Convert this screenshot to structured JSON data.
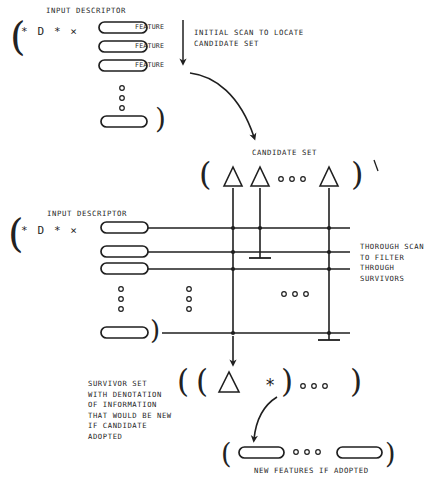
{
  "diagram": {
    "title_top": "INPUT DESCRIPTOR",
    "title_mid": "INPUT DESCRIPTOR",
    "descriptor_notation": "* D * ×",
    "feature_labels": [
      "FEATURE",
      "FEATURE",
      "FEATURE"
    ],
    "annotations": {
      "initial_scan": "INITIAL SCAN TO LOCATE\nCANDIDATE SET",
      "candidate_set": "CANDIDATE SET",
      "thorough_scan": "THOROUGH SCAN\nTO FILTER\nTHROUGH\nSURVIVORS",
      "survivor_set": "SURVIVOR SET\nWITH DENOTATION\nOF INFORMATION\nTHAT WOULD BE NEW\nIF CANDIDATE\nADOPTED",
      "new_features": "NEW FEATURES IF ADOPTED"
    },
    "glyphs": {
      "open_paren": "(",
      "close_paren": ")",
      "asterisk": "*",
      "ellipsis_dot": "○",
      "triangle": "△"
    },
    "colors": {
      "ink": "#1f1f1f",
      "paper": "#ffffff"
    },
    "counts": {
      "top_features": 3,
      "candidate_triangles": 3,
      "grid_rows": 4,
      "grid_columns": 3,
      "new_feature_pills": 2
    }
  }
}
